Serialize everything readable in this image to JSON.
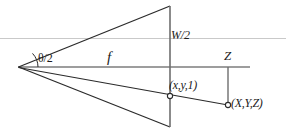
{
  "figure": {
    "kind": "pinhole-camera-projection-diagram",
    "width": 286,
    "height": 132,
    "background_color": "#ffffff",
    "line_color": "#2b2b2b",
    "axis_color": "#7a7a7a",
    "guide_color": "#c9c9c9",
    "text_color": "#1c1c1c"
  },
  "labels": {
    "half_field_of_view": "θ/2",
    "focal_length": "f",
    "half_image_width": "W/2",
    "depth": "Z",
    "image_point": "(x,y,1)",
    "world_point": "(X,Y,Z)"
  },
  "geometry": {
    "camera_center": {
      "x": 18,
      "y": 67
    },
    "image_plane": {
      "x": 170,
      "y_top": 6,
      "y_bottom": 127
    },
    "optical_axis": {
      "x1": 18,
      "y1": 67,
      "x2": 250,
      "y2": 67
    },
    "upper_guide_line": {
      "x1": 0,
      "y1": 38,
      "x2": 286,
      "y2": 38
    },
    "frustum_top_edge": {
      "x1": 18,
      "y1": 67,
      "x2": 170,
      "y2": 6
    },
    "frustum_bottom_edge": {
      "x1": 18,
      "y1": 67,
      "x2": 170,
      "y2": 127
    },
    "projection_ray": {
      "x1": 18,
      "y1": 67,
      "x2": 228,
      "y2": 105
    },
    "depth_drop_line": {
      "x1": 228,
      "y1": 67,
      "x2": 228,
      "y2": 105
    },
    "angle_arc": {
      "cx": 18,
      "cy": 67,
      "radius": 20
    },
    "image_point_marker": {
      "x": 170,
      "y": 96,
      "r": 2.6
    },
    "world_point_marker": {
      "x": 228,
      "y": 105,
      "r": 2.6
    }
  }
}
